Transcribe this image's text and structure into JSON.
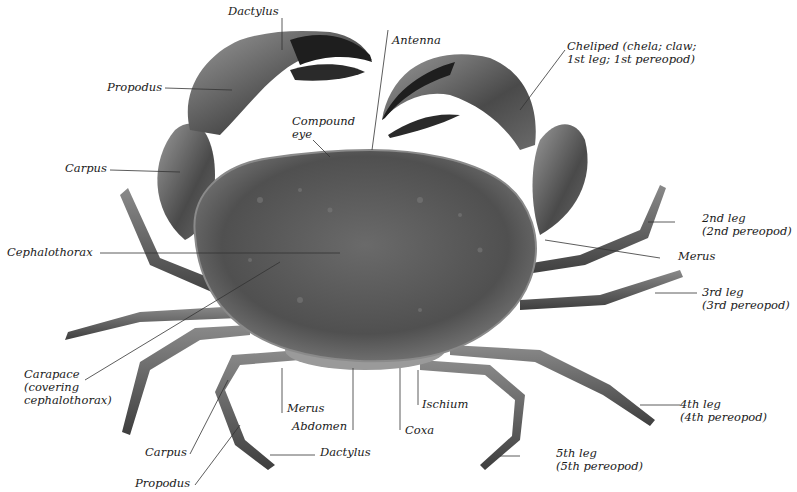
{
  "figure": {
    "colors": {
      "background": "#ffffff",
      "label_text": "#1a1a1a",
      "leader_line": "#333333",
      "carapace": "#5e5e5e",
      "claw_tip": "#1c1c1c"
    }
  },
  "labels": {
    "dactylus_claw": "Dactylus",
    "antenna": "Antenna",
    "propodus_claw": "Propodus",
    "cheliped_line1": "Cheliped (chela; claw;",
    "cheliped_line2": "1st leg; 1st pereopod)",
    "compound_eye_line1": "Compound",
    "compound_eye_line2": "eye",
    "carpus_claw": "Carpus",
    "leg2_line1": "2nd leg",
    "leg2_line2": "(2nd pereopod)",
    "cephalothorax": "Cephalothorax",
    "merus_right": "Merus",
    "leg3_line1": "3rd leg",
    "leg3_line2": "(3rd pereopod)",
    "carapace_line1": "Carapace",
    "carapace_line2": "(covering",
    "carapace_line3": "cephalothorax)",
    "leg4_line1": "4th leg",
    "leg4_line2": "(4th pereopod)",
    "merus_leg": "Merus",
    "ischium": "Ischium",
    "abdomen": "Abdomen",
    "coxa": "Coxa",
    "carpus_leg": "Carpus",
    "dactylus_leg": "Dactylus",
    "leg5_line1": "5th leg",
    "leg5_line2": "(5th pereopod)",
    "propodus_leg": "Propodus"
  }
}
